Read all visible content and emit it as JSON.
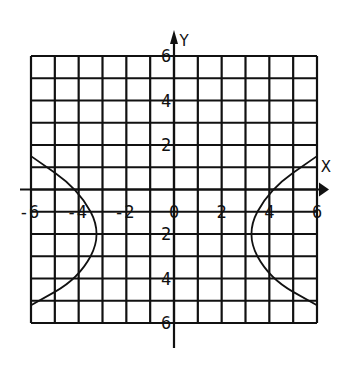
{
  "chart_data": {
    "type": "line",
    "title": "",
    "xlabel": "X",
    "ylabel": "Y",
    "xlim": [
      -6,
      6
    ],
    "ylim": [
      -6,
      6
    ],
    "grid": true,
    "grid_step": 1,
    "x_tick_labels": [
      "-6",
      "-4",
      "-2",
      "0",
      "2",
      "4",
      "6"
    ],
    "y_tick_labels_upper": [
      "6",
      "4",
      "2"
    ],
    "y_tick_labels_lower": [
      "2",
      "4",
      "6"
    ],
    "legend": null,
    "series": [
      {
        "name": "hyperbola-left-branch",
        "points": [
          [
            -6,
            1.5
          ],
          [
            -4,
            0
          ],
          [
            -3,
            -2
          ],
          [
            -4,
            -4
          ],
          [
            -6,
            -5.2
          ]
        ]
      },
      {
        "name": "hyperbola-right-branch",
        "points": [
          [
            6,
            1.5
          ],
          [
            4,
            0
          ],
          [
            3,
            -2
          ],
          [
            4,
            -4
          ],
          [
            6,
            -5.2
          ]
        ]
      }
    ]
  },
  "colors": {
    "line": "#111111",
    "background": "#ffffff"
  }
}
